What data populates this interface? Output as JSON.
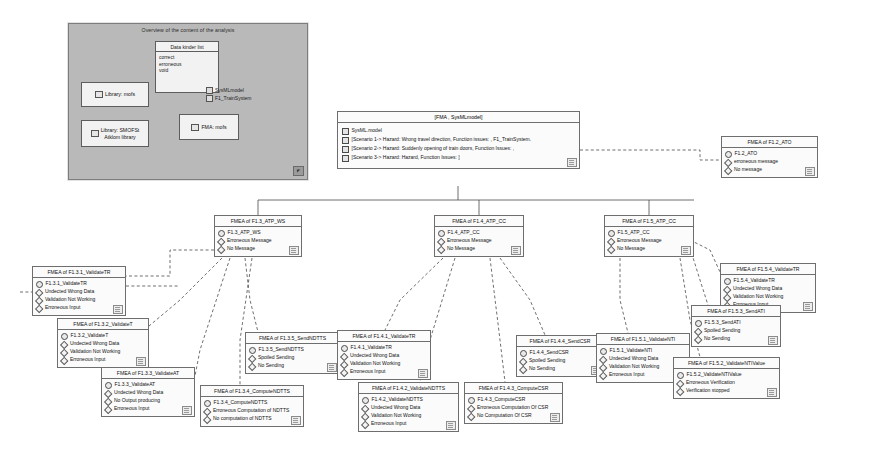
{
  "overview": {
    "title": "Overview of the content of the analysis",
    "datatype_box": {
      "header": "Data kinder list",
      "values": [
        "correct",
        "erroneous",
        "void"
      ]
    },
    "packages": [
      {
        "label": "Library: mofs"
      },
      {
        "label": "Library: SMOFSt\nAtklom library"
      },
      {
        "label": "FMA: mofs"
      }
    ],
    "models": [
      "SysMLmodel",
      "F1_TrainSystem"
    ],
    "corner_badge": "◤"
  },
  "root": {
    "title": "[FMA , SysMLmodel]",
    "rows": [
      {
        "icon": "model-icon",
        "label": "SysML.model"
      },
      {
        "icon": "scenario-icon",
        "label": "[Scenario 1-> Hazard: Wrong travel direction, Function issues: , F1_TrainSystem."
      },
      {
        "icon": "scenario-icon",
        "label": "[Scenario 2-> Hazard: Suddenly opening of train doors, Function Issues: ,"
      },
      {
        "icon": "scenario-icon",
        "label": "[Scenario 3-> Hazard: Hazard, Function Issues: ]"
      }
    ]
  },
  "nodes": [
    {
      "id": "n_f12_ato",
      "title": "FMEA of F1.2_ATO",
      "block": "F1.2_ATO",
      "items": [
        "erroneous message",
        "No message"
      ],
      "x": 721,
      "y": 136,
      "w": 97
    },
    {
      "id": "n_f13_atp_ws",
      "title": "FMEA of F1.3_ATP_WS",
      "block": "F1.3_ATP_WS",
      "items": [
        "Erroneous Message",
        "No Message"
      ],
      "x": 214,
      "y": 215,
      "w": 88
    },
    {
      "id": "n_f14_atp_cc",
      "title": "FMEA of F1.4_ATP_CC",
      "block": "F1.4_ATP_CC",
      "items": [
        "Erroneous Message",
        "No Message"
      ],
      "x": 434,
      "y": 215,
      "w": 90
    },
    {
      "id": "n_f15_atp_cc",
      "title": "FMEA of F1.5_ATP_CC",
      "block": "F1.5_ATP_CC",
      "items": [
        "Erroneous Message",
        "No Message"
      ],
      "x": 604,
      "y": 215,
      "w": 90
    },
    {
      "id": "n_f131_validatetr",
      "title": "FMEA of F1.3.1_ValidateTR",
      "block": "F1.3.1_ValidateTR",
      "items": [
        "Undected Wrong Data",
        "Validation Not Working",
        "Erroneous Input"
      ],
      "x": 32,
      "y": 266,
      "w": 94
    },
    {
      "id": "n_f132_validatet",
      "title": "FMEA of F1.3.2_ValidateT",
      "block": "F1.3.2_ValidateT",
      "items": [
        "Undected Wrong Data",
        "Validation Not Working",
        "Erroneous Input"
      ],
      "x": 57,
      "y": 318,
      "w": 92
    },
    {
      "id": "n_f133_validateat",
      "title": "FMEA of F1.3.3_ValidateAT",
      "block": "F1.3.3_ValidateAT",
      "items": [
        "Undected Wrong Data",
        "No Output producing",
        "Erroneous Input"
      ],
      "x": 101,
      "y": 367,
      "w": 94
    },
    {
      "id": "n_f135_sendndtts",
      "title": "FMEA of F1.3.5_SendNDTTS",
      "block": "F1.3.5_SendNDTTS",
      "items": [
        "Spoiled Sending",
        "No Sending"
      ],
      "x": 245,
      "y": 332,
      "w": 95
    },
    {
      "id": "n_f134_computendtts",
      "title": "FMEA of F1.3.4_ComputeNDTTS",
      "block": "F1.3.4_ComputeNDTTS",
      "items": [
        "Erroneous Computation of NDTTS",
        "No computation of NDTTS"
      ],
      "x": 200,
      "y": 385,
      "w": 104
    },
    {
      "id": "n_f141_validatetr",
      "title": "FMEA of F1.4.1_ValidateTR",
      "block": "F1.4.1_ValidateTR",
      "items": [
        "Undected Wrong Data",
        "Validation Not Working",
        "Erroneous Input"
      ],
      "x": 337,
      "y": 330,
      "w": 94
    },
    {
      "id": "n_f142_validatendtts",
      "title": "FMEA of F1.4.2_ValidateNDTTS",
      "block": "F1.4.2_ValidateNDTTS",
      "items": [
        "Undected Wrong Data",
        "Validation Not Working",
        "Erroneous Input"
      ],
      "x": 358,
      "y": 382,
      "w": 101
    },
    {
      "id": "n_f144_sendcsr",
      "title": "FMEA of F1.4.4_SendCSR",
      "block": "F1.4.4_SendCSR",
      "items": [
        "Spoiled Sending",
        "No Sending"
      ],
      "x": 516,
      "y": 335,
      "w": 88
    },
    {
      "id": "n_f143_computecsr",
      "title": "FMEA of F1.4.3_ComputeCSR",
      "block": "F1.4.3_ComputeCSR",
      "items": [
        "Erroneous Computation Of CSR",
        "No Computation Of CSR"
      ],
      "x": 464,
      "y": 382,
      "w": 99
    },
    {
      "id": "n_f151_validatenti",
      "title": "FMEA of F1.5.1_ValidateNTI",
      "block": "F1.5.1_ValidateNTI",
      "items": [
        "Undected Wrong Data",
        "Validation Not Working",
        "Erroneous Input"
      ],
      "x": 596,
      "y": 333,
      "w": 94
    },
    {
      "id": "n_f154_validatetr",
      "title": "FMEA of F1.5.4_ValidateTR",
      "block": "F1.5.4_ValidateTR",
      "items": [
        "Undected Wrong Data",
        "Validation Not Working",
        "Erroneous Input"
      ],
      "x": 720,
      "y": 263,
      "w": 96
    },
    {
      "id": "n_f153_sendati",
      "title": "FMEA of F1.5.3_SendATI",
      "block": "F1.5.3_SendATI",
      "items": [
        "Spoiled Sending",
        "No Sending"
      ],
      "x": 691,
      "y": 305,
      "w": 90
    },
    {
      "id": "n_f152_validatentivalue",
      "title": "FMEA of F1.5.2_ValidateNTIValue",
      "block": "F1.5.2_ValidateNTIValue",
      "items": [
        "Erroneous Verification",
        "Verification stopped"
      ],
      "x": 673,
      "y": 357,
      "w": 107
    }
  ],
  "colors": {
    "node_fill": "#fbfbfb",
    "node_border": "#6e6e6e",
    "overview_fill": "#b9b9b9",
    "page_bg": "#ffffff",
    "line": "#4a4a4a"
  }
}
